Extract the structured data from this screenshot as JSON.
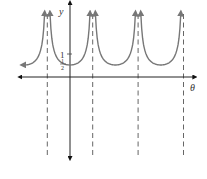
{
  "chart_data": {
    "type": "line",
    "title": "",
    "function_description": "secant-type curve with vertical asymptotes, minima at y = 1/2",
    "xlabel": "θ",
    "ylabel": "y",
    "y_tick_labels": [
      {
        "value": 1,
        "label": "1"
      },
      {
        "value": 0.5,
        "label": "1/2",
        "numerator": "1",
        "denominator": "2"
      }
    ],
    "asymptote_count": 4,
    "asymptotes_x_units": [
      -1,
      1,
      3,
      5
    ],
    "branch_minima": [
      {
        "x": 0,
        "y": 0.5
      },
      {
        "x": 2,
        "y": 0.5
      },
      {
        "x": 4,
        "y": 0.5
      }
    ],
    "partial_left_branch": {
      "from_x": -2.1,
      "to_x": -1,
      "descending_toward": "left",
      "end_y": 0.7
    },
    "xlim": [
      -2.3,
      5.5
    ],
    "ylim": [
      -3.4,
      3.1
    ],
    "grid": false,
    "axes_arrows": true,
    "colors": {
      "curve": "#777777",
      "axis": "#222222",
      "asymptote": "#555555"
    }
  }
}
